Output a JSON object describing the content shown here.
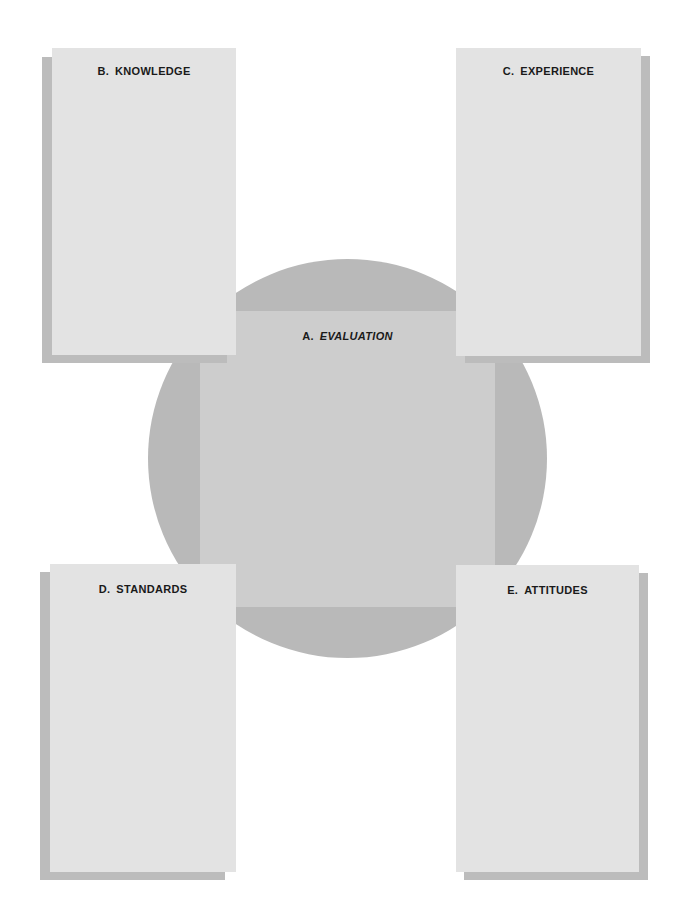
{
  "diagram": {
    "center": {
      "letter": "A.",
      "title": "EVALUATION"
    },
    "boxes": [
      {
        "id": "B",
        "letter": "B.",
        "title": "KNOWLEDGE",
        "position": "top-left"
      },
      {
        "id": "C",
        "letter": "C.",
        "title": "EXPERIENCE",
        "position": "top-right"
      },
      {
        "id": "D",
        "letter": "D.",
        "title": "STANDARDS",
        "position": "bottom-left"
      },
      {
        "id": "E",
        "letter": "E.",
        "title": "ATTITUDES",
        "position": "bottom-right"
      }
    ],
    "colors": {
      "card": "#e3e3e3",
      "shadow": "#bcbcbc",
      "circle": "#b9b9b9",
      "square": "#cdcdcd",
      "text": "#1a1a1a"
    }
  }
}
